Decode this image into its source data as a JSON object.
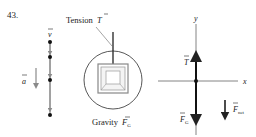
{
  "problem_number": "43.",
  "motion_diagram": {
    "velocity_label": "v",
    "acceleration_label": "a",
    "dots": 4
  },
  "pictorial": {
    "tension_label": "Tension",
    "tension_symbol": "T",
    "gravity_label": "Gravity",
    "gravity_symbol": "F",
    "gravity_subscript": "G"
  },
  "free_body": {
    "y_axis": "y",
    "x_axis": "x",
    "tension_symbol": "T",
    "gravity_symbol": "F",
    "gravity_subscript": "G",
    "net_symbol": "F",
    "net_subscript": "net"
  },
  "colors": {
    "line": "#222222",
    "gray_arrow": "#8a8a8a",
    "box_gray": "#a0a0a0"
  }
}
